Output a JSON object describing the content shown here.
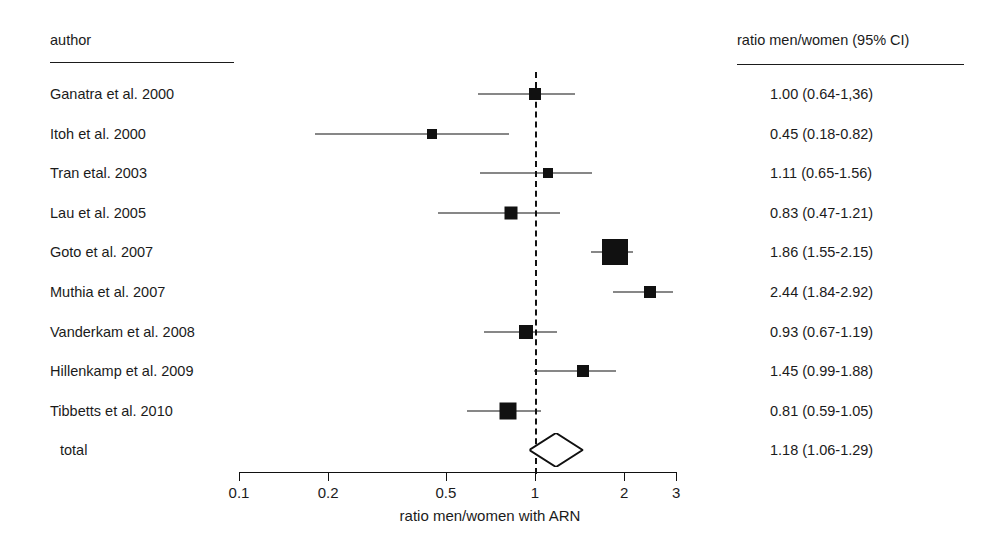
{
  "figure": {
    "type": "forest-plot",
    "axis_title": "ratio men/women with ARN",
    "column_headers": {
      "author": "author",
      "ratio": "ratio men/women (95% CI)"
    }
  },
  "chart_data": {
    "type": "forest",
    "title": "",
    "xlabel": "ratio men/women with ARN",
    "ylabel": "",
    "xscale": "log",
    "xlim": [
      0.1,
      3
    ],
    "xticks": [
      "0.1",
      "0.2",
      "0.5",
      "1",
      "2",
      "3"
    ],
    "xtick_values": [
      0.1,
      0.2,
      0.5,
      1,
      2,
      3
    ],
    "reference_line": 1.0,
    "grid": false,
    "legend": "none",
    "categories": [
      "Ganatra et al. 2000",
      "Itoh et al. 2000",
      "Tran etal. 2003",
      "Lau et al. 2005",
      "Goto et al. 2007",
      "Muthia et al. 2007",
      "Vanderkam et al. 2008",
      "Hillenkamp et al. 2009",
      "Tibbetts et al. 2010",
      "total"
    ],
    "values": [
      1.0,
      0.45,
      1.11,
      0.83,
      1.86,
      2.44,
      0.93,
      1.45,
      0.81,
      1.18
    ],
    "ci_low": [
      0.64,
      0.18,
      0.65,
      0.47,
      1.55,
      1.84,
      0.67,
      0.99,
      0.59,
      1.06
    ],
    "ci_high": [
      1.36,
      0.82,
      1.56,
      1.21,
      2.15,
      2.92,
      1.19,
      1.88,
      1.05,
      1.29
    ],
    "labels": [
      "1.00 (0.64-1,36)",
      "0.45 (0.18-0.82)",
      "1.11 (0.65-1.56)",
      "0.83 (0.47-1.21)",
      "1.86 (1.55-2.15)",
      "2.44 (1.84-2.92)",
      "0.93 (0.67-1.19)",
      "1.45 (0.99-1.88)",
      "0.81 (0.59-1.05)",
      "1.18 (1.06-1.29)"
    ],
    "marker_sizes": [
      12,
      10,
      10,
      13,
      26,
      12,
      14,
      12,
      17,
      0
    ],
    "summary_index": 9,
    "summary_marker": "diamond"
  },
  "rows": [
    {
      "author": "Ganatra et al. 2000",
      "ratio": "1.00 (0.64-1,36)"
    },
    {
      "author": "Itoh et al. 2000",
      "ratio": "0.45 (0.18-0.82)"
    },
    {
      "author": "Tran etal. 2003",
      "ratio": "1.11 (0.65-1.56)"
    },
    {
      "author": "Lau et al. 2005",
      "ratio": "0.83 (0.47-1.21)"
    },
    {
      "author": "Goto et al. 2007",
      "ratio": "1.86 (1.55-2.15)"
    },
    {
      "author": "Muthia et al. 2007",
      "ratio": "2.44 (1.84-2.92)"
    },
    {
      "author": "Vanderkam et al. 2008",
      "ratio": "0.93 (0.67-1.19)"
    },
    {
      "author": "Hillenkamp et al. 2009",
      "ratio": "1.45 (0.99-1.88)"
    },
    {
      "author": "Tibbetts et al. 2010",
      "ratio": "0.81 (0.59-1.05)"
    },
    {
      "author": "total",
      "ratio": "1.18 (1.06-1.29)"
    }
  ],
  "colors": {
    "ink": "#111111",
    "background": "#ffffff"
  }
}
